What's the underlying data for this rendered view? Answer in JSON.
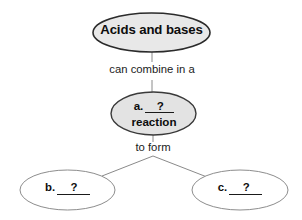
{
  "diagram": {
    "type": "concept-map",
    "background_color": "#ffffff",
    "nodes": [
      {
        "id": "top",
        "text": "Acids and bases",
        "shape": "ellipse",
        "fill": "#e8e8e8",
        "stroke": "#2b2b2b",
        "bold": true
      },
      {
        "id": "middle",
        "line1_prefix": "a.",
        "line1_blank": "?",
        "line2": "reaction",
        "shape": "ellipse",
        "fill": "#e3e3e3",
        "stroke": "#3a3a3a",
        "bold": true
      },
      {
        "id": "bottom-left",
        "prefix": "b.",
        "blank": "?",
        "shape": "ellipse",
        "fill": "#ffffff",
        "stroke": "#8d8d8d",
        "bold": true
      },
      {
        "id": "bottom-right",
        "prefix": "c.",
        "blank": "?",
        "shape": "ellipse",
        "fill": "#ffffff",
        "stroke": "#8d8d8d",
        "bold": true
      }
    ],
    "edges": [
      {
        "id": "top-to-middle",
        "label": "can combine in a",
        "from": "top",
        "to": "middle"
      },
      {
        "id": "middle-to-branches",
        "label": "to form",
        "from": "middle",
        "to": "bottom-left, bottom-right"
      }
    ]
  }
}
